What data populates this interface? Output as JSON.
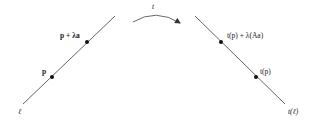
{
  "diagram": {
    "type": "line-transformation",
    "colors": {
      "line": "#555555",
      "point": "#111111",
      "text": "#222222",
      "background": "#ffffff"
    },
    "transform_label": "t",
    "left_line": {
      "label": "ℓ",
      "points": [
        {
          "id": "p",
          "label": "p"
        },
        {
          "id": "p_plus_lambda_a",
          "label": "p + λa"
        }
      ]
    },
    "right_line": {
      "label": "t(ℓ)",
      "points": [
        {
          "id": "t_p",
          "label": "t(p)"
        },
        {
          "id": "t_p_plus_lambda_Aa",
          "label": "t(p) + λ(Aa)"
        }
      ]
    }
  }
}
